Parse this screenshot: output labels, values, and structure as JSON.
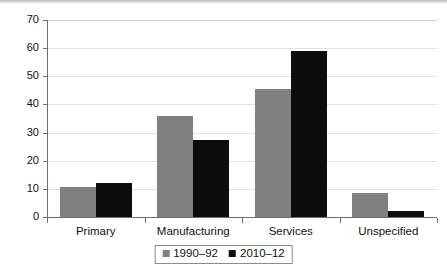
{
  "chart_data": {
    "type": "bar",
    "title": "",
    "subtitle": "",
    "xlabel": "",
    "ylabel": "",
    "categories": [
      "Primary",
      "Manufacturing",
      "Services",
      "Unspecified"
    ],
    "series": [
      {
        "name": "1990–92",
        "color": "#808080",
        "values": [
          10.5,
          36,
          45.5,
          8.5
        ]
      },
      {
        "name": "2010–12",
        "color": "#0d0d0d",
        "values": [
          12,
          27.5,
          59,
          2
        ]
      }
    ],
    "ylim": [
      0,
      70
    ],
    "yticks": [
      0,
      10,
      20,
      30,
      40,
      50,
      60,
      70
    ],
    "ytick_labels": [
      "0",
      "10",
      "20",
      "30",
      "40",
      "50",
      "60",
      "70"
    ],
    "grid": true,
    "grid_axis": "y",
    "legend_position": "bottom",
    "background": "#ffffff",
    "gridline_color": "#e2e2e2",
    "axis_color": "#6f6f6f"
  }
}
